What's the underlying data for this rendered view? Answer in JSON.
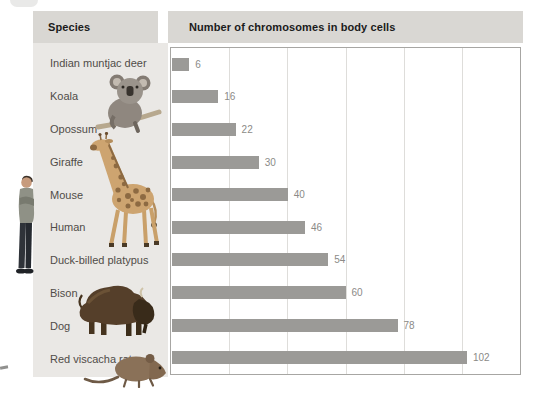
{
  "table": {
    "header": {
      "species_label": "Species",
      "chart_label": "Number of chromosomes in body cells",
      "background": "#d9d7d3"
    },
    "column_background": "#eae8e5"
  },
  "chart_data": {
    "type": "bar",
    "orientation": "horizontal",
    "title": "Number of chromosomes in body cells",
    "categories": [
      "Indian muntjac deer",
      "Koala",
      "Opossum",
      "Giraffe",
      "Mouse",
      "Human",
      "Duck-billed platypus",
      "Bison",
      "Dog",
      "Red viscacha rat"
    ],
    "values": [
      6,
      16,
      22,
      30,
      40,
      46,
      54,
      60,
      78,
      102
    ],
    "xlabel": "",
    "ylabel": "Species",
    "xlim": [
      0,
      120
    ],
    "gridline_interval": 20,
    "grid": true,
    "legend": "none",
    "bar_color": "#9b9a97",
    "value_label_color": "#8b8a87"
  },
  "illustrations": {
    "person": "person-photo",
    "koala": "koala-photo",
    "giraffe": "giraffe-photo",
    "bison": "bison-photo",
    "rat": "red-viscacha-rat-photo"
  }
}
